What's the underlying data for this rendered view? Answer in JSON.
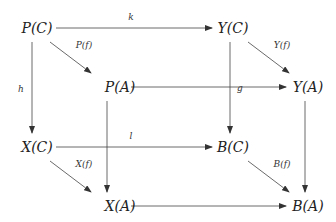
{
  "nodes": {
    "PC": {
      "label": "P(C)",
      "x": 37,
      "y": 28
    },
    "YC": {
      "label": "Y(C)",
      "x": 233,
      "y": 28
    },
    "PA": {
      "label": "P(A)",
      "x": 120,
      "y": 87
    },
    "YA": {
      "label": "Y(A)",
      "x": 308,
      "y": 87
    },
    "XC": {
      "label": "X(C)",
      "x": 37,
      "y": 147
    },
    "BC": {
      "label": "B(C)",
      "x": 233,
      "y": 147
    },
    "XA": {
      "label": "X(A)",
      "x": 120,
      "y": 206
    },
    "BA": {
      "label": "B(A)",
      "x": 308,
      "y": 206
    }
  },
  "arrows": {
    "k": {
      "label": "k",
      "from": "PC",
      "to": "YC"
    },
    "Pf": {
      "label": "P(f)",
      "from": "PC",
      "to": "PA"
    },
    "Yf": {
      "label": "Y(f)",
      "from": "YC",
      "to": "YA"
    },
    "h": {
      "label": "h",
      "from": "PC",
      "to": "XC"
    },
    "g": {
      "label": "g",
      "from": "PA",
      "to": "YA"
    },
    "l": {
      "label": "l",
      "from": "XC",
      "to": "BC"
    },
    "Xf": {
      "label": "X(f)",
      "from": "XC",
      "to": "XA"
    },
    "Bf": {
      "label": "B(f)",
      "from": "BC",
      "to": "BA"
    },
    "PA_XA": {
      "label": "",
      "from": "PA",
      "to": "XA"
    },
    "YC_BC": {
      "label": "",
      "from": "YC",
      "to": "BC"
    },
    "YA_BA": {
      "label": "",
      "from": "YA",
      "to": "BA"
    },
    "XA_BA": {
      "label": "",
      "from": "XA",
      "to": "BA"
    }
  }
}
